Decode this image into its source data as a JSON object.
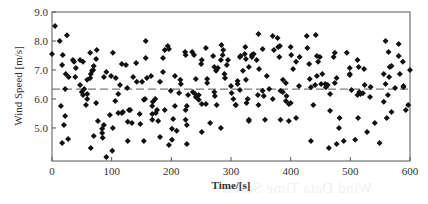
{
  "chart_data": {
    "type": "scatter",
    "title": "",
    "xlabel": "Time/[s]",
    "ylabel": "Wind Speed [m/s]",
    "xlim": [
      0,
      600
    ],
    "ylim": [
      3.86,
      9.0
    ],
    "x_ticks": [
      0,
      100,
      200,
      300,
      400,
      500,
      600
    ],
    "x_tick_labels": [
      "0",
      "100",
      "200",
      "300",
      "400",
      "500",
      "600"
    ],
    "y_ticks": [
      5.0,
      6.0,
      7.0,
      8.0,
      9.0
    ],
    "y_tick_labels": [
      "5.0",
      "6.0",
      "7.0",
      "8.0",
      "9.0"
    ],
    "grid": false,
    "legend": null,
    "reference_line": {
      "style": "dashed",
      "value": 6.34,
      "color": "#7a7a7a",
      "label": "mean"
    },
    "marker": {
      "shape": "diamond",
      "color": "#111111",
      "size": 3
    },
    "series": [
      {
        "name": "Wind Speed",
        "points": [
          [
            0,
            7.55
          ],
          [
            5,
            8.52
          ],
          [
            13,
            8.0
          ],
          [
            25,
            8.2
          ],
          [
            18,
            7.52
          ],
          [
            17,
            7.17
          ],
          [
            23,
            6.86
          ],
          [
            22,
            6.34
          ],
          [
            15,
            5.76
          ],
          [
            20,
            5.1
          ],
          [
            17,
            4.48
          ],
          [
            22,
            5.41
          ],
          [
            27,
            4.62
          ],
          [
            28,
            6.76
          ],
          [
            35,
            7.34
          ],
          [
            37,
            7.28
          ],
          [
            40,
            7.07
          ],
          [
            39,
            6.76
          ],
          [
            47,
            7.34
          ],
          [
            52,
            7.28
          ],
          [
            47,
            6.48
          ],
          [
            50,
            6.24
          ],
          [
            54,
            6.34
          ],
          [
            52,
            6.14
          ],
          [
            59,
            6.17
          ],
          [
            59,
            6.0
          ],
          [
            57,
            5.79
          ],
          [
            59,
            6.66
          ],
          [
            64,
            6.72
          ],
          [
            65,
            6.86
          ],
          [
            67,
            6.97
          ],
          [
            69,
            7.0
          ],
          [
            70,
            7.14
          ],
          [
            74,
            7.38
          ],
          [
            75,
            7.69
          ],
          [
            64,
            7.59
          ],
          [
            74,
            5.86
          ],
          [
            65,
            4.31
          ],
          [
            70,
            4.72
          ],
          [
            77,
            5.24
          ],
          [
            84,
            4.97
          ],
          [
            85,
            4.66
          ],
          [
            87,
            5.1
          ],
          [
            91,
            4.0
          ],
          [
            87,
            6.76
          ],
          [
            91,
            6.93
          ],
          [
            84,
            4.83
          ],
          [
            97,
            5.45
          ],
          [
            99,
            6.79
          ],
          [
            102,
            7.59
          ],
          [
            102,
            5.0
          ],
          [
            101,
            4.21
          ],
          [
            107,
            6.72
          ],
          [
            106,
            5.93
          ],
          [
            111,
            6.17
          ],
          [
            111,
            5.52
          ],
          [
            114,
            6.48
          ],
          [
            117,
            7.21
          ],
          [
            117,
            5.52
          ],
          [
            119,
            5.55
          ],
          [
            124,
            7.17
          ],
          [
            126,
            6.38
          ],
          [
            127,
            5.21
          ],
          [
            127,
            4.55
          ],
          [
            129,
            5.62
          ],
          [
            131,
            5.62
          ],
          [
            134,
            5.17
          ],
          [
            136,
            6.76
          ],
          [
            141,
            7.24
          ],
          [
            142,
            6.59
          ],
          [
            147,
            5.48
          ],
          [
            148,
            5.14
          ],
          [
            151,
            6.59
          ],
          [
            154,
            5.97
          ],
          [
            156,
            6.0
          ],
          [
            157,
            8.0
          ],
          [
            157,
            7.41
          ],
          [
            159,
            6.72
          ],
          [
            154,
            4.55
          ],
          [
            166,
            6.79
          ],
          [
            168,
            5.48
          ],
          [
            168,
            5.28
          ],
          [
            169,
            5.9
          ],
          [
            173,
            6.0
          ],
          [
            168,
            5.76
          ],
          [
            176,
            5.62
          ],
          [
            178,
            5.24
          ],
          [
            174,
            5.52
          ],
          [
            181,
            4.69
          ],
          [
            181,
            6.59
          ],
          [
            186,
            7.41
          ],
          [
            189,
            5.62
          ],
          [
            186,
            6.93
          ],
          [
            189,
            7.69
          ],
          [
            194,
            7.83
          ],
          [
            196,
            4.41
          ],
          [
            196,
            7.72
          ],
          [
            199,
            6.28
          ],
          [
            201,
            4.97
          ],
          [
            201,
            4.59
          ],
          [
            203,
            5.31
          ],
          [
            206,
            5.76
          ],
          [
            206,
            6.79
          ],
          [
            209,
            4.9
          ],
          [
            213,
            6.21
          ],
          [
            215,
            6.66
          ],
          [
            216,
            6.52
          ],
          [
            223,
            7.62
          ],
          [
            224,
            7.52
          ],
          [
            228,
            6.14
          ],
          [
            226,
            5.76
          ],
          [
            224,
            5.62
          ],
          [
            226,
            5.1
          ],
          [
            226,
            4.45
          ],
          [
            224,
            5.28
          ],
          [
            235,
            7.62
          ],
          [
            238,
            7.52
          ],
          [
            241,
            6.69
          ],
          [
            236,
            6.24
          ],
          [
            240,
            6.17
          ],
          [
            241,
            6.07
          ],
          [
            246,
            6.14
          ],
          [
            246,
            5.97
          ],
          [
            250,
            7.21
          ],
          [
            251,
            7.34
          ],
          [
            251,
            5.83
          ],
          [
            251,
            4.86
          ],
          [
            258,
            5.83
          ],
          [
            258,
            7.76
          ],
          [
            260,
            6.69
          ],
          [
            260,
            6.55
          ],
          [
            265,
            5.17
          ],
          [
            270,
            7.48
          ],
          [
            272,
            7.1
          ],
          [
            272,
            6.24
          ],
          [
            273,
            6.1
          ],
          [
            275,
            6.97
          ],
          [
            276,
            5.79
          ],
          [
            278,
            7.07
          ],
          [
            283,
            7.34
          ],
          [
            284,
            7.86
          ],
          [
            283,
            5.0
          ],
          [
            286,
            7.52
          ],
          [
            287,
            7.69
          ],
          [
            289,
            6.86
          ],
          [
            290,
            6.72
          ],
          [
            295,
            7.34
          ],
          [
            293,
            7.17
          ],
          [
            300,
            6.45
          ],
          [
            301,
            6.21
          ],
          [
            304,
            6.0
          ],
          [
            308,
            5.79
          ],
          [
            308,
            5.79
          ],
          [
            311,
            6.52
          ],
          [
            311,
            6.62
          ],
          [
            315,
            7.45
          ],
          [
            315,
            6.31
          ],
          [
            316,
            7.48
          ],
          [
            320,
            6.97
          ],
          [
            324,
            7.79
          ],
          [
            323,
            7.55
          ],
          [
            325,
            6.66
          ],
          [
            326,
            5.86
          ],
          [
            325,
            7.38
          ],
          [
            328,
            6.0
          ],
          [
            330,
            7.1
          ],
          [
            330,
            5.28
          ],
          [
            330,
            5.24
          ],
          [
            335,
            7.52
          ],
          [
            335,
            7.45
          ],
          [
            338,
            7.55
          ],
          [
            343,
            7.34
          ],
          [
            345,
            6.14
          ],
          [
            347,
            7.03
          ],
          [
            346,
            5.79
          ],
          [
            346,
            8.24
          ],
          [
            353,
            7.72
          ],
          [
            353,
            6.28
          ],
          [
            355,
            6.1
          ],
          [
            357,
            5.28
          ],
          [
            360,
            6.79
          ],
          [
            364,
            6.34
          ],
          [
            370,
            8.17
          ],
          [
            372,
            7.69
          ],
          [
            370,
            6.0
          ],
          [
            378,
            8.1
          ],
          [
            381,
            7.45
          ],
          [
            379,
            7.79
          ],
          [
            382,
            7.83
          ],
          [
            383,
            6.28
          ],
          [
            383,
            5.28
          ],
          [
            387,
            6.66
          ],
          [
            387,
            6.24
          ],
          [
            392,
            6.55
          ],
          [
            393,
            6.1
          ],
          [
            392,
            5.93
          ],
          [
            397,
            5.83
          ],
          [
            397,
            5.24
          ],
          [
            400,
            7.79
          ],
          [
            401,
            7.52
          ],
          [
            400,
            5.86
          ],
          [
            404,
            7.03
          ],
          [
            409,
            5.34
          ],
          [
            409,
            7.28
          ],
          [
            414,
            6.45
          ],
          [
            415,
            7.45
          ],
          [
            427,
            8.17
          ],
          [
            428,
            7.76
          ],
          [
            431,
            7.21
          ],
          [
            432,
            6.69
          ],
          [
            434,
            6.4
          ],
          [
            434,
            4.55
          ],
          [
            438,
            5.79
          ],
          [
            442,
            8.21
          ],
          [
            441,
            6.48
          ],
          [
            444,
            7.48
          ],
          [
            444,
            6.79
          ],
          [
            446,
            7.28
          ],
          [
            449,
            7.45
          ],
          [
            451,
            6.52
          ],
          [
            453,
            6.86
          ],
          [
            459,
            6.4
          ],
          [
            458,
            6.52
          ],
          [
            462,
            6.48
          ],
          [
            464,
            4.31
          ],
          [
            466,
            5.59
          ],
          [
            466,
            6.17
          ],
          [
            472,
            7.45
          ],
          [
            474,
            7.59
          ],
          [
            474,
            6.55
          ],
          [
            477,
            4.45
          ],
          [
            477,
            6.72
          ],
          [
            481,
            5.0
          ],
          [
            482,
            5.34
          ],
          [
            489,
            4.55
          ],
          [
            494,
            7.59
          ],
          [
            499,
            6.86
          ],
          [
            499,
            6.83
          ],
          [
            499,
            7.07
          ],
          [
            502,
            6.31
          ],
          [
            508,
            4.59
          ],
          [
            512,
            7.34
          ],
          [
            512,
            6.14
          ],
          [
            514,
            7.1
          ],
          [
            515,
            6.24
          ],
          [
            517,
            6.17
          ],
          [
            513,
            5.34
          ],
          [
            521,
            6.2
          ],
          [
            523,
            7.03
          ],
          [
            524,
            6.48
          ],
          [
            528,
            4.86
          ],
          [
            533,
            6.07
          ],
          [
            534,
            6.41
          ],
          [
            541,
            5.17
          ],
          [
            549,
            4.48
          ],
          [
            556,
            6.86
          ],
          [
            556,
            5.9
          ],
          [
            559,
            6.52
          ],
          [
            559,
            8.0
          ],
          [
            561,
            5.34
          ],
          [
            563,
            6.14
          ],
          [
            564,
            7.62
          ],
          [
            569,
            5.55
          ],
          [
            565,
            6.76
          ],
          [
            566,
            7.1
          ],
          [
            569,
            7.14
          ],
          [
            575,
            6.38
          ],
          [
            581,
            7.9
          ],
          [
            581,
            7.48
          ],
          [
            583,
            6.86
          ],
          [
            589,
            6.41
          ],
          [
            588,
            7.28
          ],
          [
            589,
            6.45
          ],
          [
            593,
            5.62
          ],
          [
            597,
            5.79
          ],
          [
            600,
            7.0
          ]
        ]
      }
    ]
  },
  "labels": {
    "xlabel": "Time/[s]",
    "ylabel": "Wind Speed [m/s]",
    "ghost_text": "Wind Data Time Series"
  }
}
